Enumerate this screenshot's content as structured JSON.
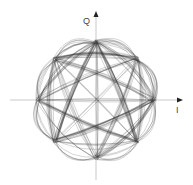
{
  "diagram": {
    "type": "iq-constellation-trajectory",
    "axes": {
      "x_label": "I",
      "y_label": "Q",
      "origin": [
        96,
        100
      ]
    },
    "constellation": {
      "name": "8-PSK",
      "points": 8,
      "radius_px": 58,
      "angles_deg": [
        0,
        45,
        90,
        135,
        180,
        225,
        270,
        315
      ]
    },
    "colors": {
      "trajectory": "#333333",
      "axis": "#bbbbbb",
      "arrow": "#222222",
      "label": "#444444"
    }
  }
}
